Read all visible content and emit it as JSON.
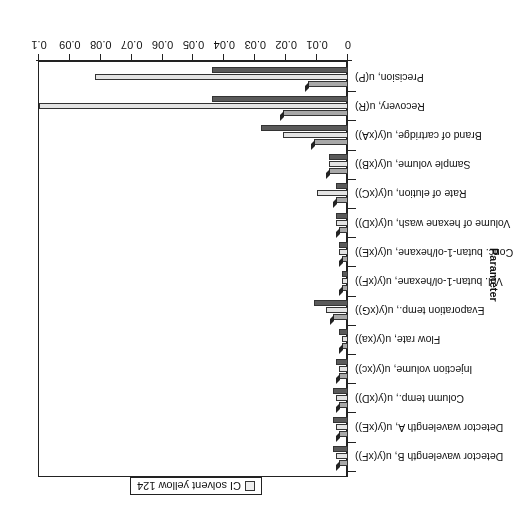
{
  "chart_data": {
    "type": "bar",
    "orientation": "horizontal",
    "rendering": "3D bar chart, image rotated 180 degrees",
    "title": "",
    "xlabel": "",
    "ylabel": "Parameter",
    "xlim": [
      0,
      0.1
    ],
    "x_ticks": [
      "0",
      "0.01",
      "0.02",
      "0.03",
      "0.04",
      "0.05",
      "0.06",
      "0.07",
      "0.08",
      "0.09",
      "0.1"
    ],
    "grid": false,
    "legend_position": "top",
    "categories": [
      "Precision, u(P)",
      "Recovery, u(R)",
      "Brand of cartridge, u(y(xA))",
      "Sample volume, u(y(xB))",
      "Rate of elution, u(y(xC))",
      "Volume of hexane wash, u(y(xD))",
      "Conc. butan-1-ol/hexane, u(y(xE))",
      "Vol. butan-1-ol/hexane, u(y(xF))",
      "Evaporation temp., u(y(xG))",
      "Flow rate, u(y(xa))",
      "Injection volume, u(y(xc))",
      "Column temp., u(y(xD))",
      "Detector wavelength A, u(y(xE))",
      "Detector wavelength B, u(y(xF))"
    ],
    "series": [
      {
        "name": "Series 1 (dark)",
        "values": [
          0.044,
          0.044,
          0.028,
          0.006,
          0.004,
          0.004,
          0.003,
          0.002,
          0.011,
          0.003,
          0.004,
          0.005,
          0.005,
          0.005
        ]
      },
      {
        "name": "Series 2 (light)",
        "values": [
          0.082,
          0.1,
          0.021,
          0.006,
          0.01,
          0.004,
          0.003,
          0.002,
          0.007,
          0.002,
          0.003,
          0.004,
          0.004,
          0.004
        ]
      },
      {
        "name": "Series 3 (medium)",
        "values": [
          0.013,
          0.021,
          0.011,
          0.006,
          0.004,
          0.003,
          0.002,
          0.002,
          0.005,
          0.002,
          0.003,
          0.003,
          0.003,
          0.003
        ]
      }
    ],
    "legend": [
      "CI solvent yellow 124"
    ]
  },
  "labels": {
    "ylabel": "Parameter",
    "legend_text": "CI solvent yellow 124"
  }
}
